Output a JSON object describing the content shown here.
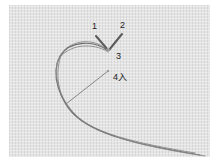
{
  "image": {
    "description": "Embroidery stitch step photo: thread on evenweave fabric with numbered needle points",
    "labels": [
      {
        "id": "1",
        "text": "1",
        "x": 92,
        "y": 22
      },
      {
        "id": "2",
        "text": "2",
        "x": 120,
        "y": 21
      },
      {
        "id": "3",
        "text": "3",
        "x": 116,
        "y": 52
      },
      {
        "id": "4",
        "text": "4入",
        "x": 113,
        "y": 73
      }
    ],
    "colors": {
      "fabric": "#e4e4e4",
      "thread": "#6e6e6e",
      "label": "#222222",
      "background": "#ffffff"
    }
  }
}
